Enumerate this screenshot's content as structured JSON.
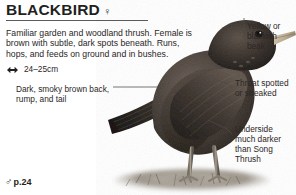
{
  "page": {
    "background_color": "#ffffff",
    "text_color": "#2b2726"
  },
  "header": {
    "species_name": "BLACKBIRD",
    "sex_symbol": "♀",
    "sex_symbol_name": "female-symbol"
  },
  "description": {
    "text": "Familiar garden and woodland thrush. Female is brown with subtle, dark spots beneath. Runs, hops, and feeds on ground and in bushes."
  },
  "size": {
    "icon": "length-arrow-icon",
    "value": "24–25cm"
  },
  "cross_reference": {
    "sex_symbol": "♂",
    "sex_symbol_name": "male-symbol",
    "page": "p.24"
  },
  "callouts": [
    {
      "id": "back",
      "text": "Dark, smoky brown back, rump, and tail",
      "position": "left"
    },
    {
      "id": "beak",
      "text": "Yellow or blackish beak",
      "position": "right-top"
    },
    {
      "id": "throat",
      "text": "Throat spotted or streaked",
      "position": "right-middle"
    },
    {
      "id": "underside",
      "text": "Underside much darker than Song Thrush",
      "position": "right-bottom"
    }
  ],
  "figure": {
    "plumage_color": "#3b332d",
    "beak_color": "#c9bca4",
    "ground_color": "#8e867a"
  }
}
